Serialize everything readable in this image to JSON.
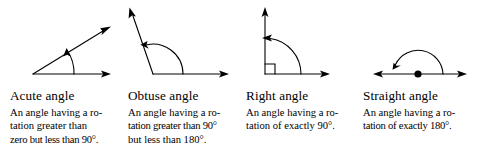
{
  "figure": {
    "panel_count": 4
  },
  "panels": [
    {
      "id": "acute",
      "heading": "Acute angle",
      "description": "An angle having a rotation greater than zero but less than 90°.",
      "lines": [
        "An angle having a ro-",
        "tation greater than",
        "zero but less than 90°."
      ],
      "diagram": {
        "name": "acute-angle-diagram",
        "vertex_label": "vertex",
        "angle_degrees": 35,
        "arc_direction": "counterclockwise",
        "rays": [
          "horizontal-ray-right",
          "slanted-ray-up-right"
        ],
        "arrowheads": 2,
        "stroke_color": "#000000"
      }
    },
    {
      "id": "obtuse",
      "heading": "Obtuse angle",
      "description": "An angle having a rotation greater than 90° but less than 180°.",
      "lines": [
        "An angle having a ro-",
        "tation greater than 90°",
        "but less than 180°."
      ],
      "diagram": {
        "name": "obtuse-angle-diagram",
        "vertex_label": "vertex",
        "angle_degrees": 125,
        "arc_direction": "counterclockwise",
        "rays": [
          "horizontal-ray-right",
          "slanted-ray-up-left"
        ],
        "arrowheads": 2,
        "stroke_color": "#000000"
      }
    },
    {
      "id": "right",
      "heading": "Right angle",
      "description": "An angle having a rotation of exactly 90°.",
      "lines": [
        "An angle having a ro-",
        "tation of exactly 90°."
      ],
      "diagram": {
        "name": "right-angle-diagram",
        "vertex_label": "vertex",
        "angle_degrees": 90,
        "arc_direction": "counterclockwise",
        "rays": [
          "horizontal-ray-right",
          "vertical-ray-up"
        ],
        "square_marker": true,
        "arrowheads": 2,
        "stroke_color": "#000000"
      }
    },
    {
      "id": "straight",
      "heading": "Straight angle",
      "description": "An angle having a rotation of exactly 180°.",
      "lines": [
        "An angle having a ro-",
        "tation of exactly 180°."
      ],
      "diagram": {
        "name": "straight-angle-diagram",
        "vertex_label": "vertex",
        "angle_degrees": 180,
        "arc_direction": "counterclockwise",
        "rays": [
          "horizontal-ray-right",
          "horizontal-ray-left"
        ],
        "vertex_dot": true,
        "arrowheads": 2,
        "stroke_color": "#000000"
      }
    }
  ],
  "colors": {
    "ink": "#000000",
    "paper": "#ffffff"
  }
}
